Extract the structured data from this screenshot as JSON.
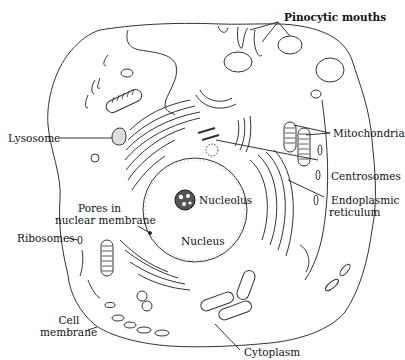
{
  "diagram": {
    "labels": {
      "pinocytic_mouths": "Pinocytic mouths",
      "lysosome": "Lysosome",
      "mitochondria": "Mitochondria",
      "centrosomes": "Centrosomes",
      "endoplasmic_reticulum_1": "Endoplasmic",
      "endoplasmic_reticulum_2": "reticulum",
      "pores_1": "Pores in",
      "pores_2": "nuclear membrane",
      "nucleolus": "Nucleolus",
      "nucleus": "Nucleus",
      "ribosomes": "Ribosomes",
      "cell_membrane_1": "Cell",
      "cell_membrane_2": "membrane",
      "cytoplasm": "Cytoplasm"
    },
    "colors": {
      "ink": "#222222",
      "background": "#ffffff"
    }
  }
}
